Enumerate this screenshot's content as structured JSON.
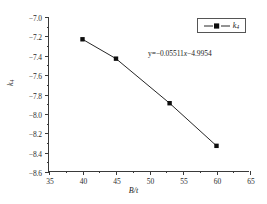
{
  "chart_data": {
    "type": "line",
    "title": "",
    "xlabel": "B/t",
    "ylabel": "k4",
    "xlim": [
      35,
      65
    ],
    "ylim": [
      -8.6,
      -7.0
    ],
    "grid": false,
    "legend_position": "top-right",
    "x": [
      40,
      45,
      53,
      60
    ],
    "series": [
      {
        "name": "k4",
        "marker": "square",
        "color": "#0d0d0d",
        "values": [
          -7.23,
          -7.43,
          -7.89,
          -8.33
        ]
      }
    ],
    "xticks": [
      35,
      40,
      45,
      50,
      55,
      60,
      65
    ],
    "xtick_labels": [
      "35",
      "40",
      "45",
      "50",
      "55",
      "60",
      "65"
    ],
    "yticks": [
      -7.0,
      -7.2,
      -7.4,
      -7.6,
      -7.8,
      -8.0,
      -8.2,
      -8.4,
      -8.6
    ],
    "ytick_labels": [
      "−7.0",
      "−7.2",
      "−7.4",
      "−7.6",
      "−7.8",
      "−8.0",
      "−8.2",
      "−8.4",
      "−8.6"
    ],
    "annotations": [
      {
        "name": "fit-equation",
        "text": "y=−0.05511x−4.9954",
        "slope": -0.05511,
        "intercept": -4.9954
      }
    ]
  },
  "axes": {
    "x_title": "B/t",
    "y_title_base": "k",
    "y_title_sub": "4"
  },
  "legend": {
    "entries": [
      {
        "label_base": "k",
        "label_sub": "4",
        "marker": "square",
        "line_style": "solid"
      }
    ]
  },
  "annotation": {
    "equation_lead": "y=−0.05511",
    "equation_var": "x",
    "equation_tail": "−4.9954"
  },
  "colors": {
    "axis": "#3a3a3a",
    "series": "#262626",
    "marker": "#0d0d0d",
    "text": "#1c1c1c",
    "background": "#ffffff"
  }
}
